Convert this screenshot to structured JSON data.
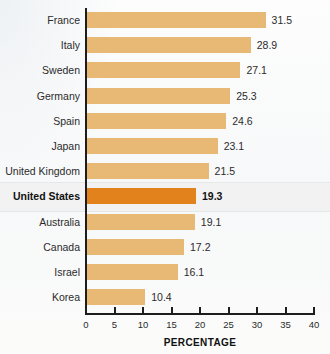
{
  "chart_data": {
    "type": "bar",
    "orientation": "horizontal",
    "title": "",
    "xlabel": "PERCENTAGE",
    "ylabel": "",
    "xlim": [
      0,
      40
    ],
    "xticks": [
      0,
      5,
      10,
      15,
      20,
      25,
      30,
      35,
      40
    ],
    "grid": false,
    "legend": null,
    "categories": [
      "France",
      "Italy",
      "Sweden",
      "Germany",
      "Spain",
      "Japan",
      "United Kingdom",
      "United States",
      "Australia",
      "Canada",
      "Israel",
      "Korea"
    ],
    "values": [
      31.5,
      28.9,
      27.1,
      25.3,
      24.6,
      23.1,
      21.5,
      19.3,
      19.1,
      17.2,
      16.1,
      10.4
    ],
    "value_labels": [
      "31.5",
      "28.9",
      "27.1",
      "25.3",
      "24.6",
      "23.1",
      "21.5",
      "19.3",
      "19.1",
      "17.2",
      "16.1",
      "10.4"
    ],
    "highlighted_category": "United States",
    "highlighted_index": 7,
    "colors": {
      "bar": "#e8b875",
      "bar_highlight": "#e1821c",
      "axis": "#1d1d1d",
      "text": "#2b2b2b",
      "background": "#fbfbfb",
      "highlight_band": "#f1f2f1"
    }
  }
}
